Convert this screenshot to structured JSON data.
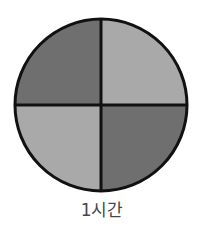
{
  "diagram": {
    "type": "quartered-circle",
    "caption": "1시간",
    "center": [
      101,
      105
    ],
    "radius": 86,
    "quadrants": [
      {
        "position": "top-left",
        "shade": "dark",
        "color": "#6f6f6f"
      },
      {
        "position": "top-right",
        "shade": "light",
        "color": "#a9a9a9"
      },
      {
        "position": "bottom-left",
        "shade": "light",
        "color": "#a9a9a9"
      },
      {
        "position": "bottom-right",
        "shade": "dark",
        "color": "#6f6f6f"
      }
    ],
    "stroke_color": "#111111"
  }
}
